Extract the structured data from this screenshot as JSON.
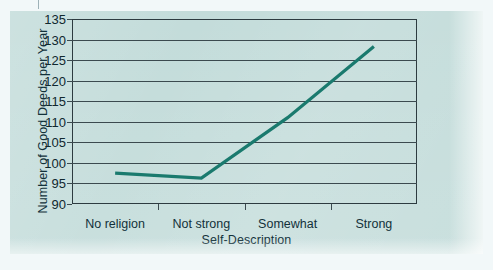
{
  "chart_data": {
    "type": "line",
    "title": "",
    "xlabel": "Self-Description",
    "ylabel": "Number of Good Deeds per Year",
    "categories": [
      "No religion",
      "Not strong",
      "Somewhat",
      "Strong"
    ],
    "values": [
      97.5,
      96.3,
      111.0,
      128.3
    ],
    "series": [
      {
        "name": "Good deeds per year",
        "values": [
          97.5,
          96.3,
          111.0,
          128.3
        ]
      }
    ],
    "ylim": [
      90,
      135
    ],
    "yticks": [
      90,
      95,
      100,
      105,
      110,
      115,
      120,
      125,
      130,
      135
    ],
    "ytick_labels": [
      "90",
      "95",
      "100",
      "105",
      "110",
      "115",
      "120",
      "125",
      "130",
      "135"
    ],
    "grid": true,
    "legend": "none",
    "markers": false,
    "line_color": "#1a7a6e",
    "plot_background": "#c3dcda",
    "axis_color": "#3b4a4f"
  },
  "figure": {
    "page_background": "#f2f8f9"
  }
}
